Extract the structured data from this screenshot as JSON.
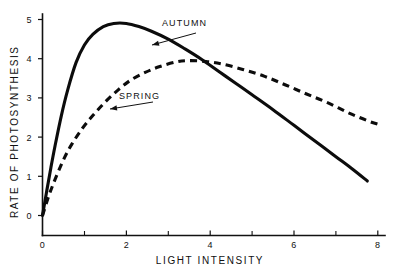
{
  "chart_data": {
    "type": "line",
    "title": "",
    "xlabel": "LIGHT INTENSITY",
    "ylabel": "RATE OF PHOTOSYNTHESIS",
    "xlim": [
      0,
      8
    ],
    "ylim": [
      0,
      5
    ],
    "xticks": [
      0,
      2,
      4,
      6,
      8
    ],
    "xtick_labels": [
      "0",
      "2",
      "4",
      "6",
      "8"
    ],
    "xticks_minor": [
      1,
      3,
      5,
      7
    ],
    "yticks": [
      0,
      1,
      2,
      3,
      4,
      5
    ],
    "ytick_labels": [
      "0",
      "1",
      "2",
      "3",
      "4",
      "5"
    ],
    "grid": false,
    "legend_position": "inline-annotations",
    "series": [
      {
        "name": "AUTUMN",
        "style": "solid",
        "color": "#0c0c0c",
        "x": [
          0.0,
          0.1,
          0.2,
          0.3,
          0.45,
          0.6,
          0.8,
          1.0,
          1.2,
          1.45,
          1.7,
          2.0,
          2.3,
          2.6,
          3.0,
          3.4,
          3.8,
          4.2,
          4.6,
          5.0,
          5.5,
          6.0,
          6.5,
          7.0,
          7.4,
          7.75
        ],
        "y": [
          0.0,
          0.62,
          1.22,
          1.78,
          2.55,
          3.2,
          3.9,
          4.35,
          4.62,
          4.82,
          4.9,
          4.9,
          4.82,
          4.7,
          4.5,
          4.25,
          3.98,
          3.68,
          3.38,
          3.08,
          2.7,
          2.3,
          1.9,
          1.5,
          1.18,
          0.88
        ]
      },
      {
        "name": "SPRING",
        "style": "dashed",
        "color": "#0c0c0c",
        "x": [
          0.0,
          0.15,
          0.3,
          0.5,
          0.7,
          0.95,
          1.2,
          1.5,
          1.8,
          2.1,
          2.45,
          2.8,
          3.2,
          3.5,
          3.9,
          4.3,
          4.8,
          5.3,
          5.8,
          6.3,
          6.8,
          7.3,
          7.8,
          8.1
        ],
        "y": [
          0.0,
          0.5,
          0.92,
          1.42,
          1.82,
          2.22,
          2.55,
          2.9,
          3.2,
          3.45,
          3.65,
          3.8,
          3.92,
          3.95,
          3.93,
          3.86,
          3.72,
          3.55,
          3.33,
          3.1,
          2.88,
          2.62,
          2.4,
          2.3
        ]
      }
    ],
    "annotations": [
      {
        "text": "AUTUMN",
        "label_x": 162,
        "label_y": 26,
        "arrow_from_x": 196,
        "arrow_from_y": 33,
        "arrow_to_x": 152,
        "arrow_to_y": 45
      },
      {
        "text": "SPRING",
        "label_x": 119,
        "label_y": 99,
        "arrow_from_x": 153,
        "arrow_from_y": 102,
        "arrow_to_x": 110,
        "arrow_to_y": 109
      }
    ]
  }
}
